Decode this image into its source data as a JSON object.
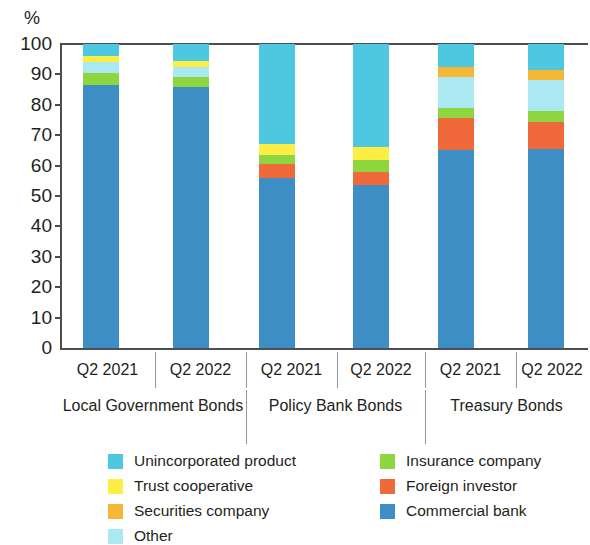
{
  "chart_data": {
    "type": "bar",
    "title": "",
    "subtitle": "",
    "xlabel": "",
    "ylabel": "%",
    "ylim": [
      0,
      100
    ],
    "grid": false,
    "stacked": true,
    "stack_total": 100,
    "legend_position": "bottom",
    "y_ticks": [
      "100",
      "90",
      "80",
      "70",
      "60",
      "50",
      "40",
      "30",
      "20",
      "10",
      "0"
    ],
    "y_tick_values": [
      100,
      90,
      80,
      70,
      60,
      50,
      40,
      30,
      20,
      10,
      0
    ],
    "categories": [
      "Q2 2021",
      "Q2 2022",
      "Q2 2021",
      "Q2 2022",
      "Q2 2021",
      "Q2 2022"
    ],
    "groups": [
      {
        "label": "Local Government Bonds",
        "categories": [
          "Q2 2021",
          "Q2 2022"
        ]
      },
      {
        "label": "Policy Bank Bonds",
        "categories": [
          "Q2 2021",
          "Q2 2022"
        ]
      },
      {
        "label": "Treasury Bonds",
        "categories": [
          "Q2 2021",
          "Q2 2022"
        ]
      }
    ],
    "series": [
      {
        "name": "Commercial bank",
        "color": "#3d8ec4",
        "values": [
          86.5,
          86.0,
          56.0,
          53.5,
          65.0,
          65.5
        ]
      },
      {
        "name": "Foreign investor",
        "color": "#f0693a",
        "values": [
          0.0,
          0.0,
          4.5,
          4.5,
          10.5,
          9.0
        ]
      },
      {
        "name": "Insurance company",
        "color": "#8ed63f",
        "values": [
          4.0,
          3.0,
          3.0,
          4.0,
          3.5,
          3.5
        ]
      },
      {
        "name": "Other",
        "color": "#aae9f2",
        "values": [
          3.5,
          3.5,
          0.0,
          0.0,
          10.0,
          10.0
        ]
      },
      {
        "name": "Securities company",
        "color": "#f5b836",
        "values": [
          0.0,
          0.0,
          0.0,
          0.0,
          3.5,
          3.5
        ]
      },
      {
        "name": "Trust cooperative",
        "color": "#fcee45",
        "values": [
          2.0,
          2.0,
          3.5,
          4.0,
          0.0,
          0.0
        ]
      },
      {
        "name": "Unincorporated product",
        "color": "#4dc8e0",
        "values": [
          4.0,
          5.5,
          33.0,
          34.0,
          7.5,
          8.5
        ]
      }
    ],
    "stack_order_bottom_to_top": [
      "Commercial bank",
      "Foreign investor",
      "Insurance company",
      "Other",
      "Securities company",
      "Trust cooperative",
      "Unincorporated product"
    ]
  },
  "legend": {
    "entries": [
      {
        "label": "Unincorporated product",
        "color": "#4dc8e0"
      },
      {
        "label": "Trust cooperative",
        "color": "#fcee45"
      },
      {
        "label": "Securities company",
        "color": "#f5b836"
      },
      {
        "label": "Other",
        "color": "#aae9f2"
      },
      {
        "label": "Insurance company",
        "color": "#8ed63f"
      },
      {
        "label": "Foreign investor",
        "color": "#f0693a"
      },
      {
        "label": "Commercial bank",
        "color": "#3d8ec4"
      }
    ]
  },
  "axis": {
    "y_unit": "%"
  },
  "colors": {
    "axis": "#4d4d4f",
    "divider": "#939598",
    "text": "#231f20",
    "background": "#ffffff"
  }
}
